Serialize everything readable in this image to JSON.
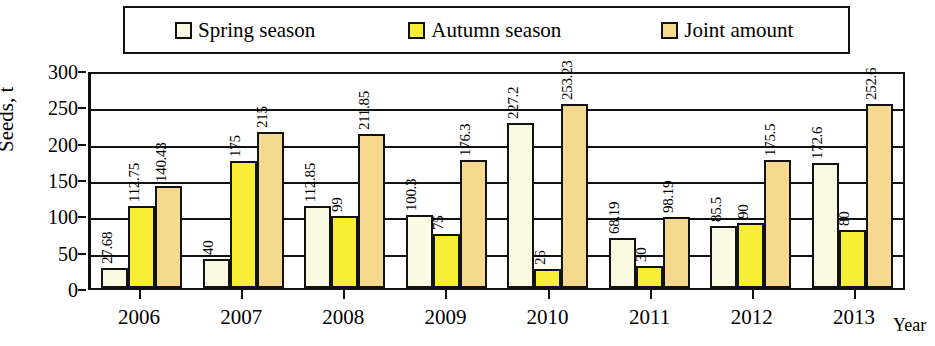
{
  "chart_data": {
    "type": "bar",
    "title": "",
    "xlabel": "Year",
    "ylabel": "Seeds, t",
    "ylim": [
      0,
      300
    ],
    "yticks": [
      0,
      50,
      100,
      150,
      200,
      250,
      300
    ],
    "ytick_labels": [
      "0",
      "50",
      "100",
      "150",
      "200",
      "250",
      "300"
    ],
    "grid": true,
    "legend_position": "top",
    "categories": [
      "2006",
      "2007",
      "2008",
      "2009",
      "2010",
      "2011",
      "2012",
      "2013"
    ],
    "series": [
      {
        "name": "Spring season",
        "color": "#fafae3",
        "values": [
          27.68,
          40,
          112.85,
          100.3,
          227.2,
          68.19,
          85.5,
          172.6
        ],
        "labels": [
          "27.68",
          "40",
          "112.85",
          "100.3",
          "227.2",
          "68.19",
          "85.5",
          "172.6"
        ]
      },
      {
        "name": "Autumn season",
        "color": "#f7ee35",
        "values": [
          112.75,
          175,
          99,
          75,
          26,
          30,
          90,
          80
        ],
        "labels": [
          "112.75",
          "175",
          "99",
          "75",
          "26",
          "30",
          "90",
          "80"
        ]
      },
      {
        "name": "Joint amount",
        "color": "#f5d98f",
        "values": [
          140.43,
          215,
          211.85,
          176.3,
          253.23,
          98.19,
          175.5,
          252.6
        ],
        "labels": [
          "140.43",
          "215",
          "211.85",
          "176.3",
          "253.23",
          "98.19",
          "175.5",
          "252.6"
        ]
      }
    ]
  },
  "legend": {
    "items": [
      {
        "label": "Spring season"
      },
      {
        "label": "Autumn season"
      },
      {
        "label": "Joint amount"
      }
    ]
  }
}
